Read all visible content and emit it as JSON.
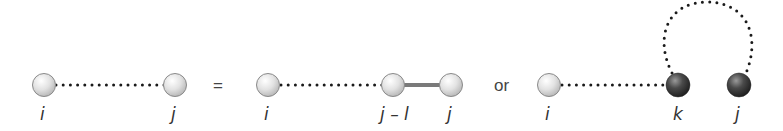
{
  "diagram": {
    "operators": {
      "equals": "=",
      "or": "or"
    },
    "panel_left": {
      "nodes": [
        {
          "id": "i",
          "label": "i",
          "style": "light"
        },
        {
          "id": "j",
          "label": "j",
          "style": "light"
        }
      ],
      "edges": [
        {
          "from": "i",
          "to": "j",
          "type": "dotted"
        }
      ]
    },
    "panel_middle": {
      "nodes": [
        {
          "id": "i",
          "label": "i",
          "style": "light"
        },
        {
          "id": "j-l",
          "label": "j – l",
          "style": "light"
        },
        {
          "id": "j",
          "label": "j",
          "style": "light"
        }
      ],
      "edges": [
        {
          "from": "i",
          "to": "j-l",
          "type": "dotted"
        },
        {
          "from": "j-l",
          "to": "j",
          "type": "solid"
        }
      ]
    },
    "panel_right": {
      "nodes": [
        {
          "id": "i",
          "label": "i",
          "style": "light"
        },
        {
          "id": "k",
          "label": "k",
          "style": "dark"
        },
        {
          "id": "j",
          "label": "j",
          "style": "dark"
        }
      ],
      "edges": [
        {
          "from": "i",
          "to": "k",
          "type": "dotted"
        },
        {
          "from": "k",
          "to": "j",
          "type": "dotted-arc"
        }
      ]
    },
    "colors": {
      "light_node": "#e6e6e6",
      "dark_node": "#3a3a3a",
      "dotted_line": "#1a1a1a",
      "solid_bond": "#888888"
    }
  }
}
